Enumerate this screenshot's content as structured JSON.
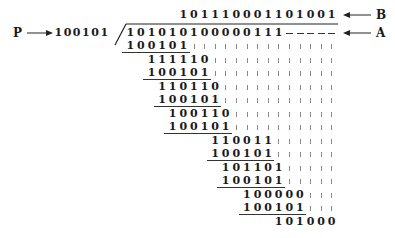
{
  "diagram": {
    "type": "binary-polynomial-long-division",
    "divisor_label": "P",
    "divisor": "100101",
    "dividend": "101010100000111",
    "dividend_padding": "-----",
    "quotient": "101110001101001",
    "quotient_label": "B",
    "dividend_label": "A",
    "remainder": "101000",
    "steps": [
      {
        "value": "100101",
        "col": 0,
        "row": 0,
        "underline": true
      },
      {
        "value": "111110",
        "col": 2,
        "row": 1,
        "underline": false
      },
      {
        "value": "100101",
        "col": 2,
        "row": 2,
        "underline": true
      },
      {
        "value": "110110",
        "col": 3,
        "row": 3,
        "underline": false
      },
      {
        "value": "100101",
        "col": 3,
        "row": 4,
        "underline": true
      },
      {
        "value": "100110",
        "col": 4,
        "row": 5,
        "underline": false
      },
      {
        "value": "100101",
        "col": 4,
        "row": 6,
        "underline": true
      },
      {
        "value": "110011",
        "col": 8,
        "row": 7,
        "underline": false
      },
      {
        "value": "100101",
        "col": 8,
        "row": 8,
        "underline": true
      },
      {
        "value": "101101",
        "col": 9,
        "row": 9,
        "underline": false
      },
      {
        "value": "100101",
        "col": 9,
        "row": 10,
        "underline": true
      },
      {
        "value": "100000",
        "col": 11,
        "row": 11,
        "underline": false
      },
      {
        "value": "100101",
        "col": 11,
        "row": 12,
        "underline": true
      },
      {
        "value": "101000",
        "col": 14,
        "row": 13,
        "underline": false
      }
    ]
  }
}
